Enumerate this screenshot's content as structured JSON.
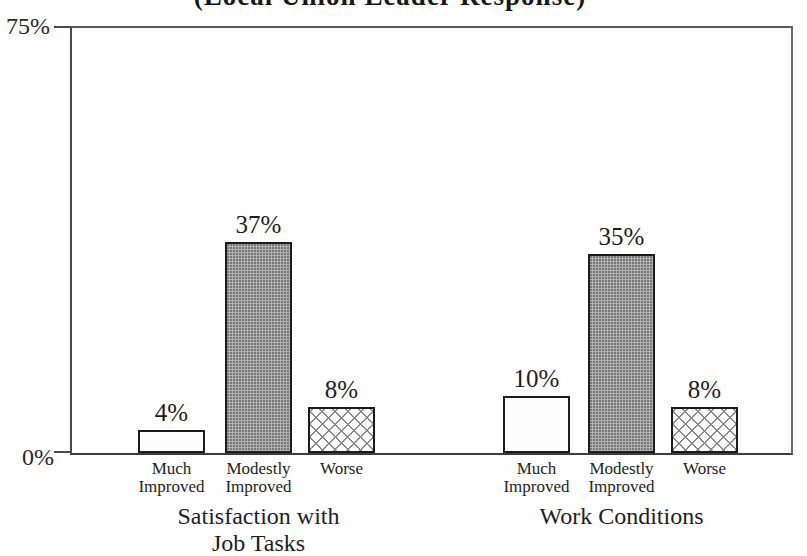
{
  "title": "(Local Union Leader Response)",
  "chart_data": {
    "type": "bar",
    "title": "(Local Union Leader Response)",
    "xlabel": "",
    "ylabel": "",
    "ylim": [
      0,
      75
    ],
    "grid": false,
    "legend": "none",
    "y_axis": {
      "min": 0,
      "max": 75,
      "min_label": "0%",
      "max_label": "75%"
    },
    "bar_categories": [
      {
        "label_lines": [
          "Much",
          "Improved"
        ],
        "fill": "plain"
      },
      {
        "label_lines": [
          "Modestly",
          "Improved"
        ],
        "fill": "stipple"
      },
      {
        "label_lines": [
          "Worse"
        ],
        "fill": "crosshatch"
      }
    ],
    "groups": [
      {
        "label_lines": [
          "Satisfaction with",
          "Job Tasks"
        ],
        "values": [
          4,
          37,
          8
        ],
        "value_labels": [
          "4%",
          "37%",
          "8%"
        ]
      },
      {
        "label_lines": [
          "Work Conditions"
        ],
        "values": [
          10,
          35,
          8
        ],
        "value_labels": [
          "10%",
          "35%",
          "8%"
        ]
      }
    ]
  },
  "colors": {
    "ink": "#1f1f1f",
    "frame": "#4a4a4a",
    "paper": "#fefefe",
    "stipple_gray": "#b0b0b0",
    "hatch_line": "#8a8a8a"
  }
}
